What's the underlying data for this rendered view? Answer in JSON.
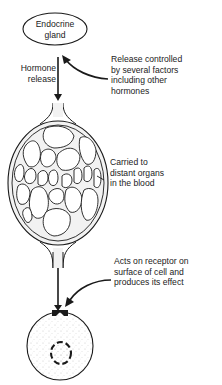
{
  "diagram": {
    "gland": {
      "label_lines": [
        "Endocrine",
        "gland"
      ]
    },
    "hormone_release": {
      "label_lines": [
        "Hormone",
        "release"
      ]
    },
    "control": {
      "label_lines": [
        "Release controlled",
        "by several factors",
        "including other",
        "hormones"
      ]
    },
    "blood": {
      "label_lines": [
        "Carried to",
        "distant organs",
        "in the blood"
      ]
    },
    "receptor": {
      "label_lines": [
        "Acts on receptor on",
        "surface of cell and",
        "produces its effect"
      ]
    },
    "colors": {
      "ink": "#1a1a1a",
      "vessel_fill": "#f2f2f2",
      "cell_stipple": "#bdbdbd",
      "background": "#ffffff"
    }
  }
}
